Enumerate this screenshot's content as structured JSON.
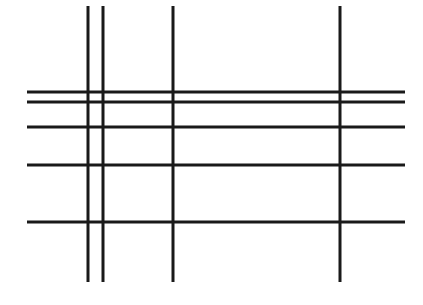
{
  "figure": {
    "background_color": "#ffffff",
    "line_color": "#1a1a1a",
    "width": 423,
    "height": 305
  },
  "chart_data": {
    "type": "line",
    "subtitle": "",
    "xlabel": "",
    "ylabel": "",
    "xlim": [
      0,
      423
    ],
    "ylim": [
      0,
      305
    ],
    "grid": false,
    "legend": "none",
    "background_color": "#ffffff",
    "stroke_color": "#1a1a1a",
    "annotations": [],
    "series": [
      {
        "name": "vertical-lines",
        "orientation": "vertical",
        "count": 4,
        "x": [
          88,
          103,
          173,
          340
        ],
        "y_start": 6,
        "y_end": 282,
        "stroke_widths": [
          3,
          3,
          3,
          3
        ]
      },
      {
        "name": "horizontal-lines",
        "orientation": "horizontal",
        "count": 5,
        "y": [
          92,
          102,
          127,
          165,
          222
        ],
        "x_start": 27,
        "x_end": 405,
        "stroke_widths": [
          3,
          3,
          3,
          3,
          3
        ]
      }
    ],
    "lines": [
      {
        "id": "v1",
        "orientation": "vertical",
        "x1": 88,
        "y1": 6,
        "x2": 88,
        "y2": 282,
        "width": 3,
        "color": "#1a1a1a"
      },
      {
        "id": "v2",
        "orientation": "vertical",
        "x1": 103,
        "y1": 6,
        "x2": 103,
        "y2": 282,
        "width": 3,
        "color": "#1a1a1a"
      },
      {
        "id": "v3",
        "orientation": "vertical",
        "x1": 173,
        "y1": 6,
        "x2": 173,
        "y2": 282,
        "width": 3,
        "color": "#1a1a1a"
      },
      {
        "id": "v4",
        "orientation": "vertical",
        "x1": 340,
        "y1": 6,
        "x2": 340,
        "y2": 282,
        "width": 3,
        "color": "#1a1a1a"
      },
      {
        "id": "h1",
        "orientation": "horizontal",
        "x1": 27,
        "y1": 92,
        "x2": 405,
        "y2": 92,
        "width": 3,
        "color": "#1a1a1a"
      },
      {
        "id": "h2",
        "orientation": "horizontal",
        "x1": 27,
        "y1": 102,
        "x2": 405,
        "y2": 102,
        "width": 3,
        "color": "#1a1a1a"
      },
      {
        "id": "h3",
        "orientation": "horizontal",
        "x1": 27,
        "y1": 127,
        "x2": 405,
        "y2": 127,
        "width": 3,
        "color": "#1a1a1a"
      },
      {
        "id": "h4",
        "orientation": "horizontal",
        "x1": 27,
        "y1": 165,
        "x2": 405,
        "y2": 165,
        "width": 3,
        "color": "#1a1a1a"
      },
      {
        "id": "h5",
        "orientation": "horizontal",
        "x1": 27,
        "y1": 222,
        "x2": 405,
        "y2": 222,
        "width": 3,
        "color": "#1a1a1a"
      }
    ]
  }
}
